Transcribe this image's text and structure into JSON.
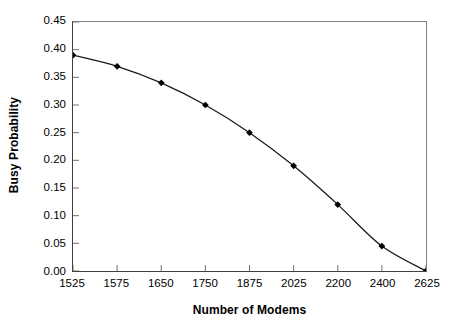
{
  "chart_data": {
    "type": "line",
    "title": "",
    "xlabel": "Number of Modems",
    "ylabel": "Busy Probability",
    "categories": [
      "1525",
      "1575",
      "1650",
      "1750",
      "1875",
      "2025",
      "2200",
      "2400",
      "2625"
    ],
    "values": [
      0.39,
      0.37,
      0.34,
      0.3,
      0.25,
      0.19,
      0.12,
      0.045,
      0.0
    ],
    "ylim": [
      0.0,
      0.45
    ],
    "ytick_labels": [
      "0.00",
      "0.05",
      "0.10",
      "0.15",
      "0.20",
      "0.25",
      "0.30",
      "0.35",
      "0.40",
      "0.45"
    ],
    "ytick_values": [
      0.0,
      0.05,
      0.1,
      0.15,
      0.2,
      0.25,
      0.3,
      0.35,
      0.4,
      0.45
    ],
    "grid": false,
    "legend": false,
    "legend_position": "none",
    "marker": "diamond",
    "marker_color": "#000000",
    "line_color": "#1a1a1a",
    "axis_color": "#404040",
    "background_color": "#ffffff",
    "series": [
      {
        "name": "Busy Probability",
        "values": [
          0.39,
          0.37,
          0.34,
          0.3,
          0.25,
          0.19,
          0.12,
          0.045,
          0.0
        ]
      }
    ],
    "points": [
      {
        "x": "1525",
        "y": 0.39
      },
      {
        "x": "1575",
        "y": 0.37
      },
      {
        "x": "1650",
        "y": 0.34
      },
      {
        "x": "1750",
        "y": 0.3
      },
      {
        "x": "1875",
        "y": 0.25
      },
      {
        "x": "2025",
        "y": 0.19
      },
      {
        "x": "2200",
        "y": 0.12
      },
      {
        "x": "2400",
        "y": 0.045
      },
      {
        "x": "2625",
        "y": 0.0
      }
    ]
  }
}
